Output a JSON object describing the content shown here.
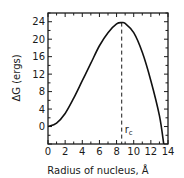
{
  "chart_data": {
    "type": "line",
    "title": "",
    "xlabel": "Radius of nucleus, Å",
    "ylabel": "ΔG (ergs)",
    "xlim": [
      0,
      14
    ],
    "ylim": [
      -4,
      26
    ],
    "xticks": [
      0,
      2,
      4,
      6,
      8,
      10,
      12,
      14
    ],
    "yticks": [
      0,
      4,
      8,
      12,
      16,
      20,
      24
    ],
    "grid": false,
    "legend": null,
    "series": [
      {
        "name": "ΔG",
        "x": [
          0,
          1,
          2,
          3,
          4,
          5,
          6,
          7,
          8,
          8.6,
          9,
          10,
          11,
          12,
          13,
          13.5
        ],
        "y": [
          0,
          0.8,
          3.0,
          6.5,
          10.5,
          14.5,
          18.5,
          21.5,
          23.5,
          23.8,
          23.6,
          21.5,
          17.0,
          10.5,
          2.5,
          -4
        ]
      }
    ],
    "annotations": [
      {
        "text": "r_c",
        "label": "rc",
        "x": 8.6,
        "type": "dashed-vertical-line"
      }
    ]
  },
  "labels": {
    "ylabel_delta": "Δ",
    "ylabel_rest": "G (ergs)",
    "xlabel": "Radius of nucleus, Å",
    "rc_main": "r",
    "rc_sub": "c"
  }
}
